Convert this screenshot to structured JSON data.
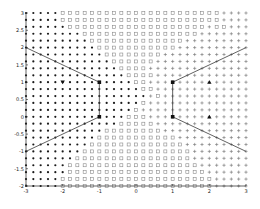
{
  "chart_data": {
    "type": "scatter",
    "title": "",
    "xlabel": "",
    "ylabel": "",
    "xlim": [
      -3,
      3
    ],
    "ylim": [
      -2,
      3
    ],
    "grid": false,
    "legend": null,
    "xticks": [
      "-3",
      "-2",
      "-1",
      "0",
      "1",
      "2",
      "3"
    ],
    "yticks": [
      "-2",
      "-1.5",
      "-1",
      "-0.5",
      "0",
      "0.5",
      "1",
      "1.5",
      "2",
      "2.5",
      "3"
    ],
    "grid_points": {
      "x_start": -3,
      "x_step": 0.2,
      "x_count": 31,
      "y_start": 3,
      "y_step": -0.2,
      "y_count": 26,
      "legend_codes": {
        "d": "dot (class A)",
        "s": "square (class B)",
        "p": "plus (class C)"
      },
      "rows": [
        "dddddsssssssssssssssssssssspppp",
        "dddddsssssssssssssssssssssspppp",
        "ddddddssssssssssssssssssspsspppp",
        "ddddddddsssssssssssssssspppppppp",
        "dddddddddssssssssssssspppppppp",
        "ddddddddddssssssssssspppppppppp",
        "dddddddddddsssssssspppppppppppp",
        "ddddddddddddsssssspppppppppppppp",
        "dddddddddddddssssppppppppppppppp",
        "ddddddddddddddsssspppppppppppppp",
        "dddddddddddddddsspppppppppppppp",
        "ddddddddddddddddsspppppppppppppp",
        "dddddddddddddddddpsppppppppppppp",
        "ddddddddddddddddsppppppppppppppp",
        "dddddddddddddddspppppppppppppppp",
        "ddddddddddddddssspppppppppppppp",
        "dddddddddddddsssssppppppppppppp",
        "dddddddddddsssssssspppppppppppp",
        "ddddddddddssssssssssspppppppppp",
        "dddddddddsssssssssssssppppppppp",
        "ddddddddssssssssssssssspppppppp",
        "dddddddssssssssssssssssppppppp",
        "ddddddsssssssssssssssssspppppp",
        "ddddddssssssssssssssssssspppppp",
        "dddddssssssssssssssssssssspppp",
        "dddddsssssssssssssssssssssppppp"
      ]
    },
    "boundary_lines": [
      [
        [
          -3,
          2
        ],
        [
          -1,
          1
        ]
      ],
      [
        [
          -1,
          1
        ],
        [
          -1,
          0
        ]
      ],
      [
        [
          -1,
          0
        ],
        [
          -3,
          -1
        ]
      ],
      [
        [
          3,
          2
        ],
        [
          1,
          1
        ]
      ],
      [
        [
          1,
          1
        ],
        [
          1,
          0
        ]
      ],
      [
        [
          1,
          0
        ],
        [
          3,
          -1
        ]
      ]
    ],
    "special_markers": [
      {
        "x": -2,
        "y": 1,
        "shape": "triangle-down"
      },
      {
        "x": -1,
        "y": 1,
        "shape": "square-filled"
      },
      {
        "x": -1,
        "y": 0,
        "shape": "square-filled"
      },
      {
        "x": 1,
        "y": 1,
        "shape": "square-filled"
      },
      {
        "x": 1,
        "y": 0,
        "shape": "square-filled"
      },
      {
        "x": 2,
        "y": 1,
        "shape": "triangle-up"
      },
      {
        "x": 2,
        "y": 0,
        "shape": "triangle-up"
      }
    ]
  },
  "style": {
    "axis_color": "#222222",
    "dot_color": "#1a1a1a",
    "square_color": "#8a8a8a",
    "plus_color": "#6e6e6e",
    "line_color": "#3a3a3a"
  }
}
